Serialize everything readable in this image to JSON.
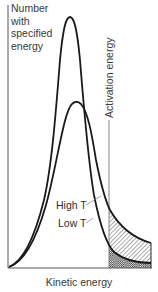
{
  "diagram": {
    "y_axis": {
      "label_lines": [
        "Number",
        "with",
        "specified",
        "energy"
      ]
    },
    "x_axis": {
      "label": "Kinetic energy"
    },
    "threshold": {
      "label": "Activation energy"
    },
    "curves": [
      {
        "id": "low-t",
        "label": "Low T",
        "description": "tall, narrow peak at lower energy"
      },
      {
        "id": "high-t",
        "label": "High T",
        "description": "lower, broader peak shifted to higher energy"
      }
    ],
    "shading": {
      "high_t_region": "diagonal hatching beyond activation energy under High T curve",
      "low_t_region": "cross-hatching beyond activation energy under Low T curve"
    },
    "colors": {
      "line": "#1a1a1a",
      "axis": "#555555",
      "text": "#3a3a3a",
      "background": "#ffffff"
    }
  }
}
